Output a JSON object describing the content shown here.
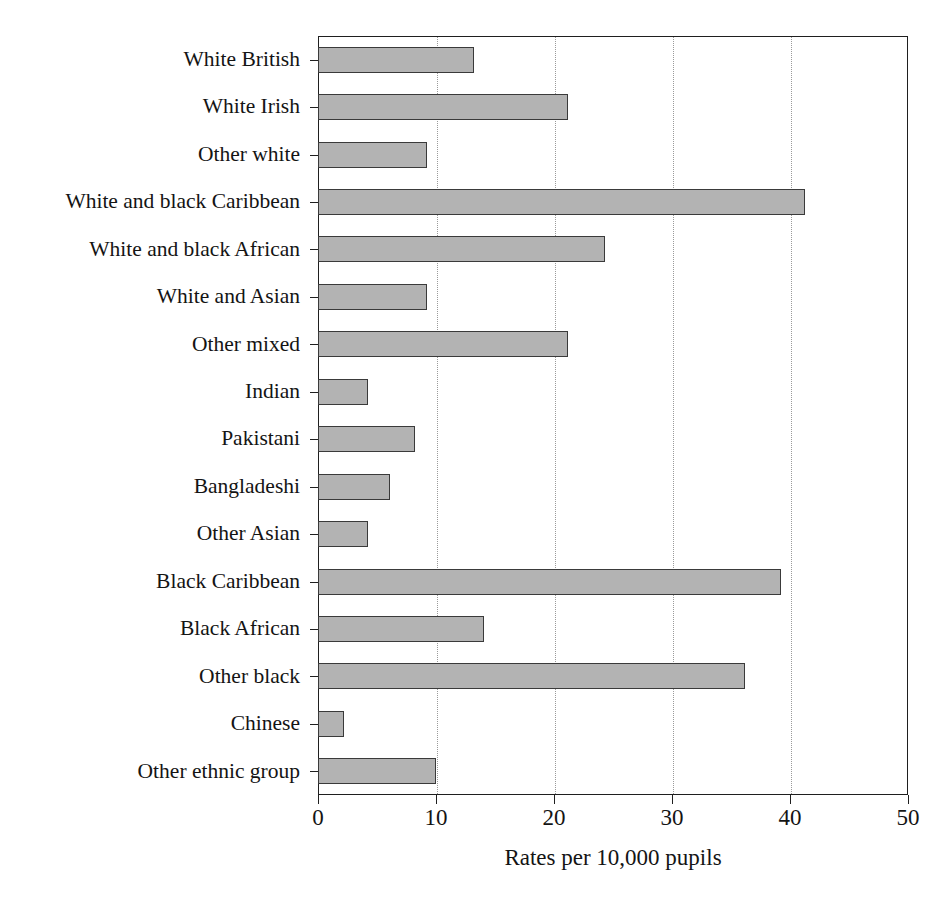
{
  "chart_data": {
    "type": "bar",
    "orientation": "horizontal",
    "title": "",
    "subtitle": "",
    "xlabel": "Rates per 10,000 pupils",
    "ylabel": "",
    "xlim": [
      0,
      50
    ],
    "xticks": [
      0,
      10,
      20,
      30,
      40,
      50
    ],
    "xtick_labels": [
      "0",
      "10",
      "20",
      "30",
      "40",
      "50"
    ],
    "grid": "vertical-dotted",
    "legend": "none",
    "categories": [
      "White British",
      "White Irish",
      "Other white",
      "White and black Caribbean",
      "White and black African",
      "White and Asian",
      "Other mixed",
      "Indian",
      "Pakistani",
      "Bangladeshi",
      "Other Asian",
      "Black Caribbean",
      "Black African",
      "Other black",
      "Chinese",
      "Other ethnic group"
    ],
    "values": [
      13.2,
      21.2,
      9.2,
      41.3,
      24.3,
      9.2,
      21.2,
      4.2,
      8.2,
      6.1,
      4.2,
      39.2,
      14.1,
      36.2,
      2.2,
      10.0
    ],
    "bar_fill_color": "#b3b3b3",
    "bar_edge_color": "#3a3a3a",
    "axis_color": "#1f1f1f",
    "grid_color": "#9a9a9a",
    "background_color": "#ffffff"
  }
}
